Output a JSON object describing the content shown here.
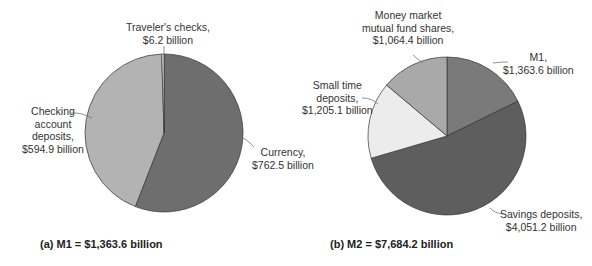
{
  "chart_data": [
    {
      "type": "pie",
      "title": "(a)  M1 = $1,363.6 billion",
      "caption_prefix": "(a)",
      "total_label": "M1 = $1,363.6 billion",
      "total": 1363.6,
      "unit": "billion USD",
      "slices": [
        {
          "name": "Currency",
          "value": 762.5,
          "label": "Currency,\n$762.5 billion",
          "color": "#6e6e6e"
        },
        {
          "name": "Checking account deposits",
          "value": 594.9,
          "label": "Checking\naccount\ndeposits,\n$594.9 billion",
          "color": "#b3b3b3"
        },
        {
          "name": "Traveler's checks",
          "value": 6.2,
          "label": "Traveler's checks,\n$6.2 billion",
          "color": "#e6e6e6"
        }
      ]
    },
    {
      "type": "pie",
      "title": "(b)  M2 = $7,684.2 billion",
      "caption_prefix": "(b)",
      "total_label": "M2 = $7,684.2 billion",
      "total": 7684.2,
      "unit": "billion USD",
      "slices": [
        {
          "name": "M1",
          "value": 1363.6,
          "label": "M1,\n$1,363.6 billion",
          "color": "#7a7a7a"
        },
        {
          "name": "Savings deposits",
          "value": 4051.2,
          "label": "Savings deposits,\n$4,051.2 billion",
          "color": "#5e5e5e"
        },
        {
          "name": "Small time deposits",
          "value": 1205.1,
          "label": "Small time\ndeposits,\n$1,205.1 billion",
          "color": "#ececec"
        },
        {
          "name": "Money market mutual fund shares",
          "value": 1064.4,
          "label": "Money market\nmutual fund shares,\n$1,064.4 billion",
          "color": "#a9a9a9"
        }
      ]
    }
  ],
  "labels": {
    "a": {
      "travelers": [
        "Traveler's checks,",
        "$6.2 billion"
      ],
      "checking": [
        "Checking",
        "account",
        "deposits,",
        "$594.9 billion"
      ],
      "currency": [
        "Currency,",
        "$762.5 billion"
      ],
      "caption": "(a)  M1 = $1,363.6 billion"
    },
    "b": {
      "mmmf": [
        "Money market",
        "mutual fund shares,",
        "$1,064.4 billion"
      ],
      "m1": [
        "M1,",
        "$1,363.6 billion"
      ],
      "small_time": [
        "Small time",
        "deposits,",
        "$1,205.1 billion"
      ],
      "savings": [
        "Savings deposits,",
        "$4,051.2 billion"
      ],
      "caption": "(b)  M2 = $7,684.2 billion"
    }
  }
}
